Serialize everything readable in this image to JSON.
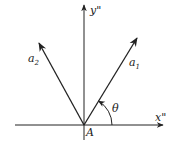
{
  "diagram": {
    "axes": {
      "x_label": "x\"",
      "y_label": "y\""
    },
    "origin_label": "A",
    "vectors": [
      {
        "name": "a",
        "subscript": "1"
      },
      {
        "name": "a",
        "subscript": "2"
      }
    ],
    "angle_label": "θ",
    "stroke_color": "#222222"
  }
}
